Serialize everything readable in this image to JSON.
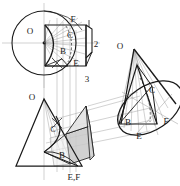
{
  "figure": {
    "kind": "descriptive-geometry-drawing",
    "background_color": "#ffffff",
    "ink_color": "#1a1a1a",
    "thin_line_color": "#8a8a8a",
    "shade_fill_color": "#c9c9c9",
    "shade_fill_color_light": "#dedede"
  },
  "views": {
    "top_view": {
      "name": "top-view-circle",
      "apex_label": "O",
      "point_labels": [
        "F",
        "C",
        "B",
        "E"
      ],
      "dimension_labels": [
        "2",
        "3"
      ]
    },
    "front_view": {
      "name": "front-view-triangle",
      "apex_label": "O",
      "point_labels": [
        "C",
        "B"
      ],
      "base_label": "E,F"
    },
    "pictorial_view": {
      "name": "pictorial-cone",
      "apex_label": "O",
      "point_labels": [
        "C",
        "B",
        "E",
        "F"
      ]
    }
  },
  "labels": {
    "top_O": "O",
    "top_F": "F",
    "top_C": "C",
    "top_B": "B",
    "top_E": "E",
    "dim_2": "2",
    "dim_3": "3",
    "front_O": "O",
    "front_C": "C",
    "front_B": "B",
    "front_EF": "E,F",
    "pic_O": "O",
    "pic_C": "C",
    "pic_B": "B",
    "pic_E": "E",
    "pic_F": "F"
  }
}
